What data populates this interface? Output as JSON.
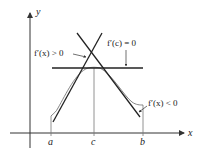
{
  "diagram": {
    "axes": {
      "x_label": "x",
      "y_label": "y"
    },
    "tick_labels": {
      "a": "a",
      "c": "c",
      "b": "b"
    },
    "annotations": {
      "increasing": "f′(x) > 0",
      "critical": "f′(c) = 0",
      "decreasing": "f′(x) < 0"
    },
    "colors": {
      "tangent_lines": "#222222",
      "curve": "#777777",
      "axes": "#333333",
      "background": "#ffffff"
    }
  }
}
